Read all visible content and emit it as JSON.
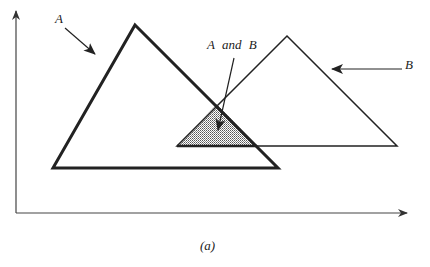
{
  "figure": {
    "caption": "(a)",
    "labels": {
      "set_a": "A",
      "set_b": "B",
      "intersection": "A and B"
    },
    "colors": {
      "stroke": "#222222",
      "axis": "#444444",
      "fill_pattern": "#555555",
      "background": "#ffffff"
    }
  },
  "shapes": {
    "triangle_a": {
      "name": "A",
      "points": [
        [
          135,
          25
        ],
        [
          278,
          168
        ],
        [
          53,
          168
        ]
      ],
      "stroke_width": 3
    },
    "triangle_b": {
      "name": "B",
      "points": [
        [
          287,
          36
        ],
        [
          397,
          146
        ],
        [
          177,
          146
        ]
      ],
      "stroke_width": 1.5
    },
    "intersection": {
      "name": "A and B",
      "points": [
        [
          217,
          104
        ],
        [
          257,
          146
        ],
        [
          177,
          146
        ]
      ]
    }
  },
  "axes": {
    "y_axis": {
      "x": 16,
      "y_top": 10,
      "y_bottom": 213
    },
    "x_axis": {
      "y": 213,
      "x_left": 16,
      "x_right": 408
    }
  }
}
